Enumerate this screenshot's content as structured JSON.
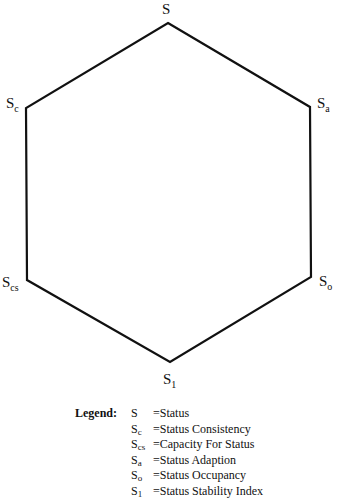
{
  "diagram": {
    "type": "hexagon",
    "vertices": [
      {
        "id": "S",
        "base": "S",
        "sub": "",
        "x": 168,
        "y": 23
      },
      {
        "id": "Sa",
        "base": "S",
        "sub": "a",
        "x": 310,
        "y": 107
      },
      {
        "id": "So",
        "base": "S",
        "sub": "o",
        "x": 311,
        "y": 277
      },
      {
        "id": "S1",
        "base": "S",
        "sub": "1",
        "x": 170,
        "y": 362
      },
      {
        "id": "Scs",
        "base": "S",
        "sub": "cs",
        "x": 27,
        "y": 280
      },
      {
        "id": "Sc",
        "base": "S",
        "sub": "c",
        "x": 26,
        "y": 108
      }
    ],
    "line_color": "#111111"
  },
  "labels": {
    "top": {
      "base": "S",
      "sub": ""
    },
    "upper_left": {
      "base": "S",
      "sub": "c"
    },
    "upper_right": {
      "base": "S",
      "sub": "a"
    },
    "lower_left": {
      "base": "S",
      "sub": "cs"
    },
    "lower_right": {
      "base": "S",
      "sub": "o"
    },
    "bottom": {
      "base": "S",
      "sub": "1"
    }
  },
  "legend": {
    "title": "Legend:",
    "items": [
      {
        "base": "S",
        "sub": "",
        "text": "=Status"
      },
      {
        "base": "S",
        "sub": "c",
        "text": "=Status Consistency"
      },
      {
        "base": "S",
        "sub": "cs",
        "text": "=Capacity For Status"
      },
      {
        "base": "S",
        "sub": "a",
        "text": "=Status Adaption"
      },
      {
        "base": "S",
        "sub": "o",
        "text": "=Status Occupancy"
      },
      {
        "base": "S",
        "sub": "1",
        "text": "=Status Stability Index"
      }
    ]
  }
}
